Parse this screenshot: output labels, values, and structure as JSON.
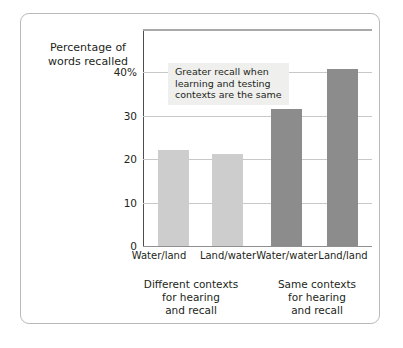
{
  "figure": {
    "background_color": "#ffffff",
    "frame_color": "#b9b9b9"
  },
  "chart_data": {
    "type": "bar",
    "title": "",
    "subtitle": "",
    "xlabel": "",
    "ylabel": "Percentage of\nwords recalled",
    "categories": [
      "Water/land",
      "Land/water",
      "Water/water",
      "Land/land"
    ],
    "values": [
      21.5,
      20.5,
      30.5,
      39.5
    ],
    "bar_colors": [
      "#cdcdcd",
      "#cdcdcd",
      "#8c8c8c",
      "#8c8c8c"
    ],
    "ylim": [
      0,
      48
    ],
    "yticks": [
      0,
      10,
      20,
      30,
      40
    ],
    "ytick_labels": [
      "0",
      "10",
      "20",
      "30",
      "40%"
    ],
    "grid": true,
    "grid_axis": "y",
    "grid_color": "#c8c8c8",
    "legend": "none",
    "annotations": [
      {
        "text": "Greater recall when\nlearning and testing\ncontexts are the same",
        "background_color": "#efefed"
      }
    ],
    "group_captions": [
      "Different contexts\nfor hearing\nand recall",
      "Same contexts\nfor hearing\nand recall"
    ]
  },
  "axis": {
    "y_title": "Percentage of\nwords recalled",
    "tick_0": "0",
    "tick_10": "10",
    "tick_20": "20",
    "tick_30": "30",
    "tick_40": "40%"
  },
  "categories": {
    "c0": "Water/land",
    "c1": "Land/water",
    "c2": "Water/water",
    "c3": "Land/land"
  },
  "groups": {
    "g0": "Different contexts\nfor hearing\nand recall",
    "g1": "Same contexts\nfor hearing\nand recall"
  },
  "annotation": {
    "text": "Greater recall when\nlearning and testing\ncontexts are the same"
  }
}
